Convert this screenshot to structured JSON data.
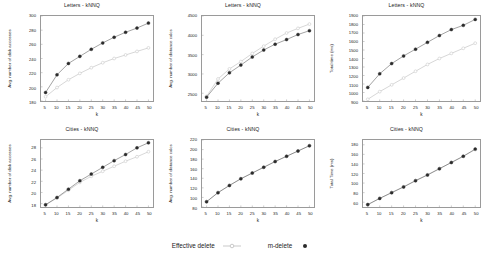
{
  "figure": {
    "width": 491,
    "height": 257,
    "background": "#ffffff",
    "rows": 2,
    "cols": 3
  },
  "legend": {
    "position": "bottom-center",
    "entries": [
      {
        "label": "Effective delete",
        "marker": "circle-open-light",
        "color": "#c9c9c9"
      },
      {
        "label": "m-delete",
        "marker": "circle-filled-dark",
        "color": "#2b2b2b"
      }
    ]
  },
  "series_names": [
    "Effective delete",
    "m-delete"
  ],
  "colors": {
    "effective_delete": "#c9c9c9",
    "m_delete": "#2b2b2b",
    "axis": "#9a9a9a",
    "text": "#1a1a1a"
  },
  "chart_data": [
    {
      "id": "letters-disk-accesses",
      "type": "line",
      "title": "Letters - kNNQ",
      "xlabel": "k",
      "ylabel": "Avg. number of disk accesses",
      "x": [
        5,
        10,
        15,
        20,
        25,
        30,
        35,
        40,
        45,
        50
      ],
      "xlim": [
        3,
        52
      ],
      "ylim": [
        180,
        300
      ],
      "xticks": [
        5,
        10,
        15,
        20,
        25,
        30,
        35,
        40,
        45,
        50
      ],
      "yticks": [
        180,
        200,
        220,
        240,
        260,
        280,
        300
      ],
      "grid": false,
      "series": [
        {
          "name": "Effective delete",
          "values": [
            186,
            199,
            210,
            219,
            227,
            234,
            240,
            245,
            250,
            255
          ]
        },
        {
          "name": "m-delete",
          "values": [
            192,
            217,
            233,
            243,
            253,
            262,
            270,
            277,
            283,
            290
          ]
        }
      ]
    },
    {
      "id": "letters-distance-calcs",
      "type": "line",
      "title": "Letters - kNNQ",
      "xlabel": "k",
      "ylabel": "Avg. number of distance calcs",
      "x": [
        5,
        10,
        15,
        20,
        25,
        30,
        35,
        40,
        45,
        50
      ],
      "xlim": [
        3,
        52
      ],
      "ylim": [
        2300,
        4500
      ],
      "xticks": [
        5,
        10,
        15,
        20,
        25,
        30,
        35,
        40,
        45,
        50
      ],
      "yticks": [
        2500,
        3000,
        3500,
        4000,
        4500
      ],
      "grid": false,
      "series": [
        {
          "name": "Effective delete",
          "values": [
            2420,
            2870,
            3130,
            3320,
            3530,
            3720,
            3900,
            4060,
            4180,
            4290
          ]
        },
        {
          "name": "m-delete",
          "values": [
            2400,
            2760,
            3030,
            3230,
            3440,
            3620,
            3770,
            3890,
            4020,
            4120
          ]
        }
      ]
    },
    {
      "id": "letters-total-time",
      "type": "line",
      "title": "Letters - kNNQ",
      "xlabel": "k",
      "ylabel": "Total time (ms)",
      "x": [
        5,
        10,
        15,
        20,
        25,
        30,
        35,
        40,
        45,
        50
      ],
      "xlim": [
        3,
        52
      ],
      "ylim": [
        900,
        1900
      ],
      "xticks": [
        5,
        10,
        15,
        20,
        25,
        30,
        35,
        40,
        45,
        50
      ],
      "yticks": [
        900,
        1000,
        1100,
        1200,
        1300,
        1400,
        1500,
        1600,
        1700,
        1800,
        1900
      ],
      "grid": false,
      "series": [
        {
          "name": "Effective delete",
          "values": [
            920,
            1010,
            1090,
            1170,
            1250,
            1330,
            1400,
            1460,
            1520,
            1580
          ]
        },
        {
          "name": "m-delete",
          "values": [
            1060,
            1220,
            1340,
            1430,
            1510,
            1590,
            1670,
            1740,
            1790,
            1860
          ]
        }
      ]
    },
    {
      "id": "cities-disk-accesses",
      "type": "line",
      "title": "Cities - kNNQ",
      "xlabel": "k",
      "ylabel": "Avg. number of disk accesses",
      "x": [
        5,
        10,
        15,
        20,
        25,
        30,
        35,
        40,
        45,
        50
      ],
      "xlim": [
        3,
        52
      ],
      "ylim": [
        17.4,
        29.4
      ],
      "xticks": [
        5,
        10,
        15,
        20,
        25,
        30,
        35,
        40,
        45,
        50
      ],
      "yticks": [
        18,
        20,
        22,
        24,
        26,
        28
      ],
      "grid": false,
      "series": [
        {
          "name": "Effective delete",
          "values": [
            17.8,
            19.0,
            20.4,
            21.8,
            22.9,
            23.8,
            24.7,
            25.6,
            26.4,
            27.3
          ]
        },
        {
          "name": "m-delete",
          "values": [
            17.8,
            19.1,
            20.6,
            22.1,
            23.3,
            24.5,
            25.7,
            26.8,
            28.0,
            28.9
          ]
        }
      ]
    },
    {
      "id": "cities-distance-calcs",
      "type": "line",
      "title": "Cities - kNNQ",
      "xlabel": "k",
      "ylabel": "Avg. number of distance calcs",
      "x": [
        5,
        10,
        15,
        20,
        25,
        30,
        35,
        40,
        45,
        50
      ],
      "xlim": [
        3,
        52
      ],
      "ylim": [
        80,
        220
      ],
      "xticks": [
        5,
        10,
        15,
        20,
        25,
        30,
        35,
        40,
        45,
        50
      ],
      "yticks": [
        80,
        100,
        120,
        140,
        160,
        180,
        200,
        220
      ],
      "grid": false,
      "series": [
        {
          "name": "Effective delete",
          "values": [
            91,
            110,
            125,
            139,
            151,
            163,
            175,
            186,
            197,
            208
          ]
        },
        {
          "name": "m-delete",
          "values": [
            91,
            110,
            125,
            139,
            151,
            163,
            175,
            186,
            197,
            208
          ]
        }
      ]
    },
    {
      "id": "cities-total-time",
      "type": "line",
      "title": "Cities - kNNQ",
      "xlabel": "k",
      "ylabel": "Total Time (ms)",
      "x": [
        5,
        10,
        15,
        20,
        25,
        30,
        35,
        40,
        45,
        50
      ],
      "xlim": [
        3,
        52
      ],
      "ylim": [
        50,
        190
      ],
      "xticks": [
        5,
        10,
        15,
        20,
        25,
        30,
        35,
        40,
        45,
        50
      ],
      "yticks": [
        60,
        80,
        100,
        120,
        140,
        160,
        180
      ],
      "grid": false,
      "series": [
        {
          "name": "Effective delete",
          "values": [
            55,
            68,
            80,
            92,
            105,
            117,
            130,
            143,
            156,
            170
          ]
        },
        {
          "name": "m-delete",
          "values": [
            55,
            68,
            80,
            92,
            105,
            117,
            130,
            143,
            156,
            171
          ]
        }
      ]
    }
  ]
}
